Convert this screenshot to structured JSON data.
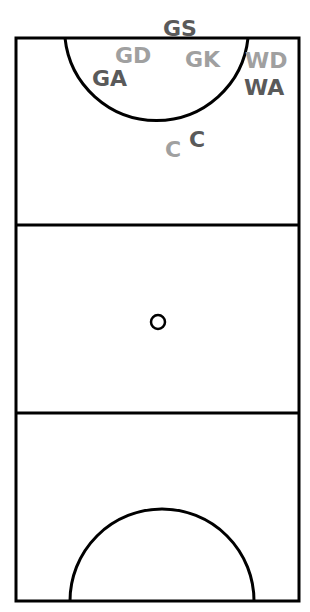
{
  "diagram": {
    "colors": {
      "lines": "#000000",
      "team_dark": "#5a5a5a",
      "team_light": "#a0a0a0",
      "background": "#ffffff"
    },
    "labels": [
      {
        "text": "GS",
        "team": "dark",
        "x": 163,
        "y": 36
      },
      {
        "text": "GD",
        "team": "light",
        "x": 115,
        "y": 63
      },
      {
        "text": "GK",
        "team": "light",
        "x": 185,
        "y": 67
      },
      {
        "text": "WD",
        "team": "light",
        "x": 245,
        "y": 68
      },
      {
        "text": "GA",
        "team": "dark",
        "x": 92,
        "y": 86
      },
      {
        "text": "WA",
        "team": "dark",
        "x": 244,
        "y": 95
      },
      {
        "text": "C",
        "team": "dark",
        "x": 189,
        "y": 147
      },
      {
        "text": "C",
        "team": "light",
        "x": 165,
        "y": 157
      }
    ]
  }
}
